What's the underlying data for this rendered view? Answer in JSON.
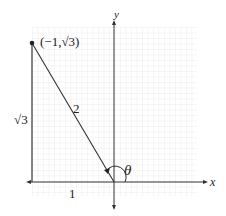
{
  "diagram": {
    "type": "unit-circle-reference-triangle",
    "axes": {
      "x_label": "x",
      "y_label": "y"
    },
    "point": {
      "label": "(−1,√3)",
      "x": -1,
      "y": "sqrt(3)"
    },
    "sides": {
      "hypotenuse": "2",
      "vertical": "√3",
      "horizontal": "1"
    },
    "angle": {
      "label": "θ"
    },
    "colors": {
      "grid": "#dcdcdc",
      "lines": "#333333",
      "background": "#ffffff"
    }
  }
}
